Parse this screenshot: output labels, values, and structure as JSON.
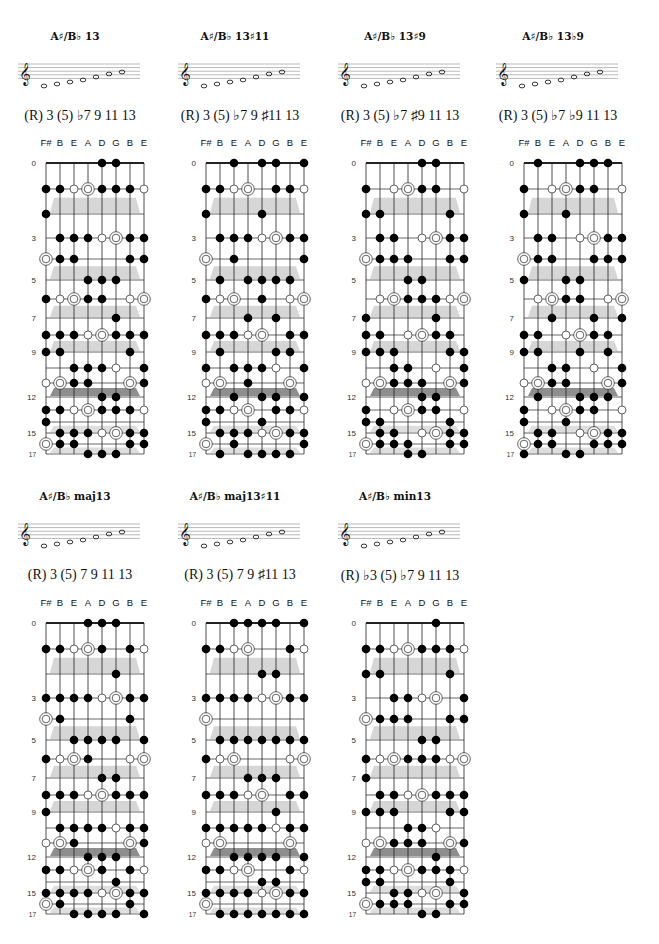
{
  "strings": [
    "F#",
    "B",
    "E",
    "A",
    "D",
    "G",
    "B",
    "E"
  ],
  "fret_labels": [
    {
      "fret": 0,
      "label": "0"
    },
    {
      "fret": 3,
      "label": "3"
    },
    {
      "fret": 5,
      "label": "5"
    },
    {
      "fret": 7,
      "label": "7"
    },
    {
      "fret": 9,
      "label": "9"
    },
    {
      "fret": 12,
      "label": "12"
    },
    {
      "fret": 15,
      "label": "15"
    },
    {
      "fret": 17,
      "label": "17"
    }
  ],
  "legend": {
    "f": "chord tone",
    "o": "fifth (optional)",
    "r": "root"
  },
  "panels": [
    {
      "title": "A♯/B♭ 13",
      "formula": "(R) 3 (5) ♭7 9 11 13",
      "dots": "0:4f,5f|1:0f,1f,2o,3r,4f,5f,6f,7o|2:0f|3:1f,2f,3f,4o,5r,6f,7f|4:0r,1f,2f,6f,7f|5:3f,4f,5f|6:0f,1o,2r,3f,4f,6o,7r|7:5f|8:0f,1f,2f,3o,4r,5f,6f,7f|9:0f,1f,6f|10:2f,3f,4f,5o,7f|11:0o,1r,2f,3f,6r,7f|12:4f,5f|13:0f,1f,2o,3r,4f,5f,6f,7o|14:0f|15:1f,2f,3f,4o,5r,6f,7f|16:0r,1f,2f,6f,7f|17:3f,4f,5f"
    },
    {
      "title": "A♯/B♭ 13♯11",
      "formula": "(R) 3 (5) ♭7 9 ♯11 13",
      "dots": "0:2f,4f,5f,7f|1:0f,1f,2o,3r,5f,6f,7o|2:0f,4f|3:1f,2f,3f,4o,5r,6f,7f|4:0r,2f,7f|5:1f,3f,4f,5f,6f|6:0f,1o,2r,4f,6o,7r|7:3f,5f|8:0f,1f,2f,3o,4r,6f,7f|9:1f,5f,6f|10:0f,2f,3f,4f,5o,7f|11:0o,1r,3f,6r|12:2f,4f,5f,7f|13:0f,1f,2o,3r,5f,6f,7o|14:0f,4f|15:1f,2f,3f,4o,5r,6f,7f|16:0r,2f,7f|17:1f,3f,4f,5f,6f"
    },
    {
      "title": "A♯/B♭ 13♯9",
      "formula": "(R) 3 (5) ♭7 ♯9 11 13",
      "dots": "0:4f,5f|1:0f,2o,3r,4f,5f,7o|2:0f,1f,6f|3:1f,2f,4o,5r,6f,7f|4:0r,1f,2f,3f,6f,7f|5:3f,4f|6:1o,2r,3f,4f,5f,6o,7r|7:0f,5f|8:0f,1f,3o,4r,5f,6f|9:0f,1f,2f,6f,7f|10:2f,3f,5o,7f|11:0o,1r,2f,3f,4f,6r,7f|12:4f,5f|13:0f,2o,3r,4f,5f,7o|14:0f,1f,6f|15:1f,2f,4o,5r,6f,7f|16:0r,1f,2f,3f,6f,7f|17:3f,4f"
    },
    {
      "title": "A♯/B♭ 13♭9",
      "formula": "(R) 3 (5) ♭7 ♭9 11 13",
      "dots": "0:1f,4f,5f,6f|1:0f,2o,3r,4f,5f,7o|2:0f,3f|3:1f,2f,4o,5r,6f,7f|4:0r,1f,2f,5f,6f,7f|5:0f,3f,4f|6:1o,2r,3f,4f,6o,7r|7:2f,5f,7f|8:0f,1f,3o,4r,5f,6f|9:0f,1f,4f,6f|10:2f,3f,5o,7f|11:0o,1r,2f,3f,6r,7f|12:1f,4f,5f,6f|13:0f,2o,3r,4f,5f,7o|14:0f,3f|15:1f,2f,4o,5r,6f,7f|16:0r,1f,2f,5f,6f,7f|17:0f,3f,4f"
    },
    {
      "title": "A♯/B♭ maj13",
      "formula": "(R) 3 (5) 7 9 11 13",
      "dots": "0:3f,4f,5f|1:0f,1f,2o,3r,4f,6f,7o|2:5f|3:0f,1f,2f,3f,4o,5r,6f,7f|4:0r,1f,6f|5:2f,3f,4f,5f,7f|6:0f,1o,2r,3f,6o,7r|7:4f,5f|8:0f,1f,2f,3o,4r,5f,6f,7f|9:0f|10:1f,2f,3f,4f,5o,6f,7f|11:0o,1r,2f,6r,7f|12:3f,4f,5f|13:0f,1f,2o,3r,4f,6f,7o|14:5f|15:0f,1f,2f,3f,4o,5r,6f,7f|16:0r,1f,6f|17:2f,3f,4f,5f,7f"
    },
    {
      "title": "A♯/B♭ maj13♯11",
      "formula": "(R) 3 (5) 7 9 ♯11 13",
      "dots": "0:2f,3f,4f,5f,7f|1:0f,1f,2o,3r,6f,7o|2:4f,5f|3:0f,1f,2f,3f,4o,5r,6f,7f|4:0r|5:1f,2f,3f,4f,5f,6f,7f|6:0f,1o,2r,6o,7r|7:3f,4f,5f|8:0f,1f,2f,3o,4r,6f,7f|9:5f|10:0f,1f,2f,3f,4f,5o,6f,7f|11:0o,1r,6r|12:2f,3f,4f,5f,7f|13:0f,1f,2o,3r,6f,7o|14:4f,5f|15:0f,1f,2f,3f,4o,5r,6f,7f|16:0r|17:1f,2f,3f,4f,5f,6f,7f"
    },
    {
      "title": "A♯/B♭ min13",
      "formula": "(R) ♭3 (5) ♭7 9 11 13",
      "dots": "0:5f|1:0f,1f,2o,3r,4f,5f,6f,7o|2:0f,1f,6f|3:2f,3f,4o,5r,7f|4:0r,1f,2f,3f,6f,7f|5:4f,5f|6:0f,1o,2r,3f,4f,5f,6o,7r|7:0f|8:1f,2f,3o,4r,5f,6f,7f|9:0f,1f,2f,6f,7f|10:3f,4f,5o|11:0o,1r,2f,3f,4f,6r,7f|12:5f|13:0f,1f,2o,3r,4f,5f,6f,7o|14:0f,1f,6f|15:2f,3f,4o,5r,7f|16:0r,1f,2f,3f,6f,7f|17:4f,5f"
    }
  ]
}
